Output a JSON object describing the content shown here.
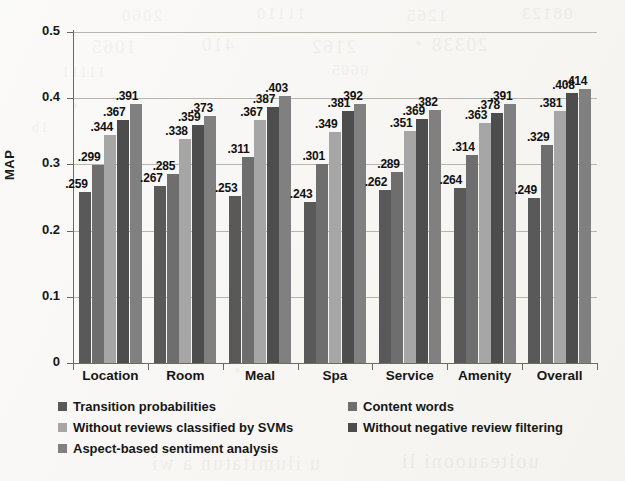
{
  "figure": {
    "background_color": "#f6f5f2",
    "axis_color": "#6e6a63",
    "grid_color": "#b9b5ad"
  },
  "axis": {
    "y_title": "MAP",
    "y_ticks": [
      "0",
      "0.1",
      "0.2",
      "0.3",
      "0.4",
      "0.5"
    ]
  },
  "legend": {
    "columns": [
      {
        "items": [
          {
            "label": "Transition probabilities",
            "color": "#595959"
          },
          {
            "label": "Without reviews classified by SVMs",
            "color": "#a6a6a6"
          },
          {
            "label": "Aspect-based sentiment analysis",
            "color": "#808080"
          }
        ]
      },
      {
        "items": [
          {
            "label": "Content words",
            "color": "#6e6e6e"
          },
          {
            "label": "Without negative review filtering",
            "color": "#4d4d4d"
          }
        ]
      }
    ]
  },
  "chart_data": {
    "type": "bar",
    "title": "",
    "xlabel": "",
    "ylabel": "MAP",
    "ylim": [
      0,
      0.5
    ],
    "yticks": [
      0,
      0.1,
      0.2,
      0.3,
      0.4,
      0.5
    ],
    "grid": true,
    "legend_position": "bottom",
    "data_labels": true,
    "categories": [
      "Location",
      "Room",
      "Meal",
      "Spa",
      "Service",
      "Amenity",
      "Overall"
    ],
    "series": [
      {
        "name": "Transition probabilities",
        "color": "#595959",
        "values": [
          0.259,
          0.267,
          0.253,
          0.243,
          0.262,
          0.264,
          0.249
        ],
        "labels": [
          ".259",
          ".267",
          ".253",
          ".243",
          ".262",
          ".264",
          ".249"
        ]
      },
      {
        "name": "Content words",
        "color": "#6e6e6e",
        "values": [
          0.299,
          0.285,
          0.311,
          0.301,
          0.289,
          0.314,
          0.329
        ],
        "labels": [
          ".299",
          ".285",
          ".311",
          ".301",
          ".289",
          ".314",
          ".329"
        ]
      },
      {
        "name": "Without reviews classified by SVMs",
        "color": "#a6a6a6",
        "values": [
          0.344,
          0.338,
          0.367,
          0.349,
          0.351,
          0.363,
          0.381
        ],
        "labels": [
          ".344",
          ".338",
          ".367",
          ".349",
          ".351",
          ".363",
          ".381"
        ]
      },
      {
        "name": "Without negative review filtering",
        "color": "#4d4d4d",
        "values": [
          0.367,
          0.359,
          0.387,
          0.381,
          0.369,
          0.378,
          0.408
        ],
        "labels": [
          ".367",
          ".359",
          ".387",
          ".381",
          ".369",
          ".378",
          ".408"
        ]
      },
      {
        "name": "Aspect-based sentiment analysis",
        "color": "#808080",
        "values": [
          0.391,
          0.373,
          0.403,
          0.392,
          0.382,
          0.391,
          0.414
        ],
        "labels": [
          ".391",
          ".373",
          ".403",
          ".392",
          ".382",
          ".391",
          ".414"
        ]
      }
    ]
  },
  "background_bleed": [
    {
      "text": "2060",
      "x": 120,
      "y": 6,
      "size": 17
    },
    {
      "text": "11110",
      "x": 255,
      "y": 4,
      "size": 17
    },
    {
      "text": "1265",
      "x": 405,
      "y": 6,
      "size": 17
    },
    {
      "text": "08123",
      "x": 520,
      "y": 4,
      "size": 17
    },
    {
      "text": "1065",
      "x": 90,
      "y": 36,
      "size": 19
    },
    {
      "text": "410",
      "x": 200,
      "y": 34,
      "size": 19
    },
    {
      "text": "2162",
      "x": 310,
      "y": 36,
      "size": 19
    },
    {
      "text": "20338",
      "x": 430,
      "y": 34,
      "size": 19
    },
    {
      "text": "11111",
      "x": 60,
      "y": 64,
      "size": 15
    },
    {
      "text": "0605",
      "x": 330,
      "y": 62,
      "size": 15
    },
    {
      "text": "1b",
      "x": 30,
      "y": 120,
      "size": 14
    },
    {
      "text": "u ilumitatun a wi",
      "x": 150,
      "y": 452,
      "size": 20
    },
    {
      "text": "uoiteauooni li",
      "x": 400,
      "y": 450,
      "size": 20
    }
  ]
}
